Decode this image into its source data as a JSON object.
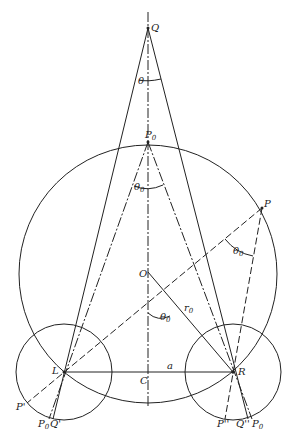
{
  "figure": {
    "points": {
      "Q": "Q",
      "P0": "P",
      "P0_sub": "0",
      "P": "P",
      "O": "O",
      "L": "L",
      "R": "R",
      "C": "C",
      "P_prime": "P'",
      "P0_prime": "P",
      "P0_prime_sub": "0",
      "P0_prime_sup": "'",
      "Q_prime": "Q'",
      "P_dprime": "P''",
      "Q_dprime": "Q''",
      "P0_dprime": "P",
      "P0_dprime_sub": "0",
      "P0_dprime_sup": "''"
    },
    "angles": {
      "theta_at_Q": "θ",
      "theta0_at_P0": "θ",
      "theta0_at_P0_sub": "0",
      "theta0_at_P": "θ",
      "theta0_at_P_sub": "0",
      "theta0_at_O": "θ",
      "theta0_at_O_sub": "0"
    },
    "lengths": {
      "radius_label": "r",
      "radius_sub": "0",
      "half_base_label": "a"
    }
  },
  "caption": ""
}
